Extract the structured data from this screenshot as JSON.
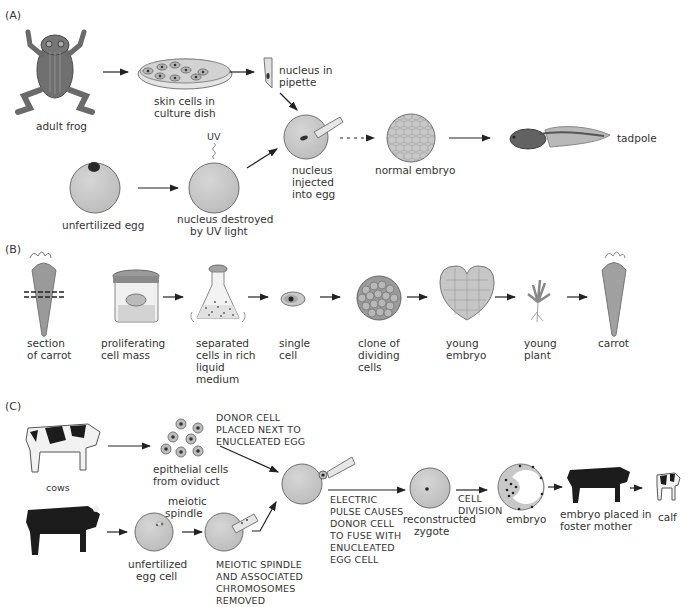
{
  "panels": {
    "A": {
      "label": "(A)",
      "labels": {
        "adult_frog": "adult frog",
        "skin_cells_1": "skin cells in",
        "skin_cells_2": "culture dish",
        "nucleus_pipette_1": "nucleus in",
        "nucleus_pipette_2": "pipette",
        "uv": "UV",
        "unfertilized_egg": "unfertilized egg",
        "nucleus_destroyed_1": "nucleus destroyed",
        "nucleus_destroyed_2": "by UV light",
        "nucleus_injected_1": "nucleus",
        "nucleus_injected_2": "injected",
        "nucleus_injected_3": "into egg",
        "normal_embryo": "normal embryo",
        "tadpole": "tadpole"
      }
    },
    "B": {
      "label": "(B)",
      "labels": {
        "section_1": "section",
        "section_2": "of carrot",
        "prolif_1": "proliferating",
        "prolif_2": "cell mass",
        "separated_1": "separated",
        "separated_2": "cells in rich",
        "separated_3": "liquid",
        "separated_4": "medium",
        "single_1": "single",
        "single_2": "cell",
        "clone_1": "clone of",
        "clone_2": "dividing",
        "clone_3": "cells",
        "young_embryo_1": "young",
        "young_embryo_2": "embryo",
        "young_plant_1": "young",
        "young_plant_2": "plant",
        "carrot": "carrot"
      }
    },
    "C": {
      "label": "(C)",
      "labels": {
        "cows": "cows",
        "epithelial_1": "epithelial cells",
        "epithelial_2": "from oviduct",
        "donor_1": "DONOR CELL",
        "donor_2": "PLACED NEXT TO",
        "donor_3": "ENUCLEATED EGG",
        "meiotic_1": "meiotic",
        "meiotic_2": "spindle",
        "unfert_1": "unfertilized",
        "unfert_2": "egg cell",
        "removed_1": "MEIOTIC SPINDLE",
        "removed_2": "AND ASSOCIATED",
        "removed_3": "CHROMOSOMES",
        "removed_4": "REMOVED",
        "electric_1": "ELECTRIC",
        "electric_2": "PULSE CAUSES",
        "electric_3": "DONOR CELL",
        "electric_4": "TO FUSE WITH",
        "electric_5": "ENUCLEATED",
        "electric_6": "EGG CELL",
        "recon_1": "reconstructed",
        "recon_2": "zygote",
        "division_1": "CELL",
        "division_2": "DIVISION",
        "embryo": "embryo",
        "foster_1": "embryo placed in",
        "foster_2": "foster mother",
        "calf": "calf"
      }
    }
  },
  "colors": {
    "cell_fill": "#c9c9c9",
    "cell_stroke": "#6e6e6e",
    "nucleus": "#3a3a3a",
    "frog": "#6f6f6f",
    "carrot": "#9a9a9a",
    "arrow": "#222222",
    "cow_black": "#1c1c1c"
  }
}
